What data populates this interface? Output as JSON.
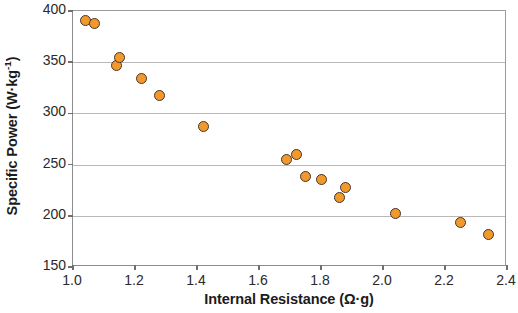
{
  "chart_data": {
    "type": "scatter",
    "title": "",
    "xlabel": "Internal Resistance (Ω·g)",
    "ylabel_text": "Specific Power (W·kg",
    "ylabel_sup": "-1",
    "ylabel_tail": ")",
    "ylabel_full": "Specific Power (W·kg⁻¹)",
    "xlim": [
      1.0,
      2.4
    ],
    "ylim": [
      150,
      400
    ],
    "xticks": [
      1.0,
      1.2,
      1.4,
      1.6,
      1.8,
      2.0,
      2.2,
      2.4
    ],
    "xtick_labels": [
      "1.0",
      "1.2",
      "1.4",
      "1.6",
      "1.8",
      "2.0",
      "2.2",
      "2.4"
    ],
    "yticks": [
      150,
      200,
      250,
      300,
      350,
      400
    ],
    "ytick_labels": [
      "150",
      "200",
      "250",
      "300",
      "350",
      "400"
    ],
    "grid": true,
    "grid_axis": "y",
    "legend": null,
    "marker_fill": "#f2992e",
    "marker_edge": "#4a3526",
    "series": [
      {
        "name": "Specific Power vs Internal Resistance",
        "x": [
          1.04,
          1.07,
          1.14,
          1.15,
          1.22,
          1.28,
          1.42,
          1.69,
          1.72,
          1.75,
          1.8,
          1.86,
          1.88,
          2.04,
          2.25,
          2.34
        ],
        "y": [
          391,
          388,
          347,
          355,
          334,
          317,
          287,
          255,
          260,
          238,
          235,
          218,
          228,
          202,
          193,
          182
        ]
      }
    ]
  }
}
